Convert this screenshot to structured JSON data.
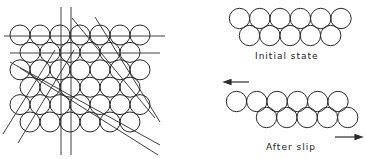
{
  "figure": {
    "left_panel": {
      "description": "close-packed layer of spheres with slip-plane lines",
      "rows": [
        7,
        6,
        7,
        6,
        7,
        6
      ]
    },
    "right_panel": {
      "initial": {
        "label": "Initial state",
        "top_row": 6,
        "bottom_row": 5
      },
      "after": {
        "label": "After slip",
        "top_row": 6,
        "bottom_row": 5
      }
    },
    "colors": {
      "stroke": "#2a2a2a",
      "background": "#ffffff"
    }
  }
}
